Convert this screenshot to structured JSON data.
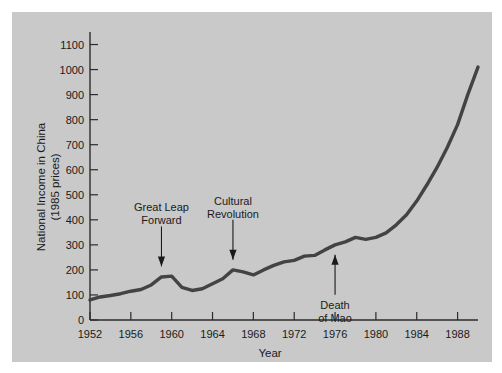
{
  "figure": {
    "panel_background": "#c9c9c9",
    "page_background": "#ffffff",
    "line_color": "#434343"
  },
  "chart_data": {
    "type": "line",
    "title": "",
    "xlabel": "Year",
    "ylabel": "National Income in China (1985 prices)",
    "ylabel_line1": "National Income in China",
    "ylabel_line2": "(1985 prices)",
    "xlim": [
      1952,
      1990
    ],
    "ylim": [
      0,
      1150
    ],
    "xticks": [
      1952,
      1956,
      1960,
      1964,
      1968,
      1972,
      1976,
      1980,
      1984,
      1988
    ],
    "yticks": [
      0,
      100,
      200,
      300,
      400,
      500,
      600,
      700,
      800,
      900,
      1000,
      1100
    ],
    "grid": false,
    "legend": "none",
    "x": [
      1952,
      1953,
      1954,
      1955,
      1956,
      1957,
      1958,
      1959,
      1960,
      1961,
      1962,
      1963,
      1964,
      1965,
      1966,
      1967,
      1968,
      1969,
      1970,
      1971,
      1972,
      1973,
      1974,
      1975,
      1976,
      1977,
      1978,
      1979,
      1980,
      1981,
      1982,
      1983,
      1984,
      1985,
      1986,
      1987,
      1988,
      1989,
      1990
    ],
    "values": [
      80,
      92,
      98,
      105,
      115,
      122,
      140,
      172,
      175,
      130,
      118,
      125,
      145,
      165,
      200,
      192,
      180,
      200,
      218,
      232,
      238,
      255,
      258,
      280,
      300,
      312,
      330,
      322,
      330,
      348,
      380,
      420,
      475,
      540,
      610,
      690,
      780,
      900,
      1010
    ],
    "annotations": [
      {
        "label": "Great Leap Forward",
        "label_line1": "Great Leap",
        "label_line2": "Forward",
        "target_year": 1959,
        "target_value": 178,
        "direction": "down"
      },
      {
        "label": "Cultural Revolution",
        "label_line1": "Cultural",
        "label_line2": "Revolution",
        "target_year": 1966,
        "target_value": 205,
        "direction": "down"
      },
      {
        "label": "Death of Mao",
        "label_line1": "Death",
        "label_line2": "of Mao",
        "target_year": 1976,
        "target_value": 296,
        "direction": "up"
      }
    ]
  }
}
